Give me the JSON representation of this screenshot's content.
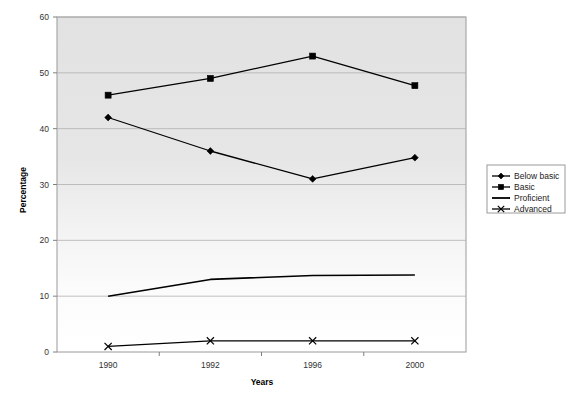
{
  "chart_data": {
    "type": "line",
    "title": "",
    "xlabel": "Years",
    "ylabel": "Percentage",
    "categories": [
      "1990",
      "1992",
      "1996",
      "2000"
    ],
    "ylim": [
      0,
      60
    ],
    "yticks": [
      0,
      10,
      20,
      30,
      40,
      50,
      60
    ],
    "grid": true,
    "legend_position": "right",
    "series": [
      {
        "name": "Below basic",
        "marker": "diamond",
        "values": [
          42,
          36,
          31,
          34.8
        ]
      },
      {
        "name": "Basic",
        "marker": "square",
        "values": [
          46,
          49,
          53,
          47.7
        ]
      },
      {
        "name": "Proficient",
        "marker": "none",
        "values": [
          10,
          13,
          13.7,
          13.8
        ]
      },
      {
        "name": "Advanced",
        "marker": "cross",
        "values": [
          1,
          2,
          2,
          2
        ]
      }
    ]
  },
  "axes": {
    "y_tick_labels": [
      "0",
      "10",
      "20",
      "30",
      "40",
      "50",
      "60"
    ],
    "x_tick_labels": [
      "1990",
      "1992",
      "1996",
      "2000"
    ],
    "y_axis_title": "Percentage",
    "x_axis_title": "Years"
  },
  "legend": {
    "items": [
      {
        "label": "Below basic",
        "marker": "diamond"
      },
      {
        "label": "Basic",
        "marker": "square"
      },
      {
        "label": "Proficient",
        "marker": "none"
      },
      {
        "label": "Advanced",
        "marker": "cross"
      }
    ]
  },
  "colors": {
    "series_line": "#000000",
    "plot_bg_top": "#e2e2e2",
    "plot_bg_bottom": "#ffffff",
    "gridline": "#b0b0b0",
    "axis": "#808080",
    "legend_border": "#9a9a9a",
    "text": "#222222"
  }
}
